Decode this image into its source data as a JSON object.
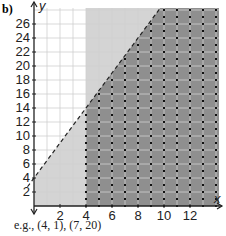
{
  "label": "b)",
  "caption": "e.g., (4, 1), (7, 20)",
  "chart_data": {
    "type": "inequality-region",
    "title": "",
    "xlabel": "x",
    "ylabel": "y",
    "xlim": [
      0,
      14
    ],
    "ylim": [
      0,
      28
    ],
    "x_ticks": [
      2,
      4,
      6,
      8,
      10,
      12
    ],
    "y_ticks": [
      2,
      4,
      6,
      8,
      10,
      12,
      14,
      16,
      18,
      20,
      22,
      24,
      26
    ],
    "grid": true,
    "boundaries": [
      {
        "type": "dashed-line",
        "equation": "y = 2.5x + 4",
        "points": [
          [
            0,
            4
          ],
          [
            9.6,
            28
          ]
        ]
      },
      {
        "type": "dotted-line",
        "equation": "x = 4"
      }
    ],
    "regions": [
      {
        "description": "x >= 4 and y < 2.5x + 4 (solution region)",
        "shade": "dark"
      },
      {
        "description": "x < 4, below dashed line",
        "shade": "light"
      },
      {
        "description": "x >= 4, above dashed line",
        "shade": "light"
      }
    ],
    "integer_points_marked": "dots at integer points in solution region",
    "colors": {
      "dark": "#8f8f8f",
      "light": "#d4d4d4",
      "grid": "#cfcfcf"
    }
  },
  "axis": {
    "x_name": "x",
    "y_name": "y",
    "x_ticks": [
      "2",
      "4",
      "6",
      "8",
      "10",
      "12"
    ],
    "y_ticks": [
      "2",
      "4",
      "6",
      "8",
      "10",
      "12",
      "14",
      "16",
      "18",
      "20",
      "22",
      "24",
      "26"
    ]
  }
}
